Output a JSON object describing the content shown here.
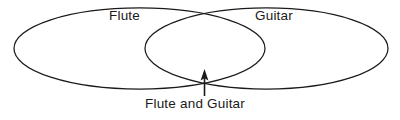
{
  "diagram": {
    "type": "venn-diagram",
    "title_text": "",
    "background_color": "#ffffff",
    "stroke_color": "#1a1a1a",
    "sets": [
      {
        "id": "left-set",
        "label": "Flute",
        "label_position": "top-left"
      },
      {
        "id": "right-set",
        "label": "Guitar",
        "label_position": "top-right"
      }
    ],
    "intersection": {
      "label": "Flute and Guitar",
      "label_position": "bottom-center",
      "pointer": "arrow-up"
    },
    "icons": {
      "pointer": "arrow-up-icon"
    }
  }
}
